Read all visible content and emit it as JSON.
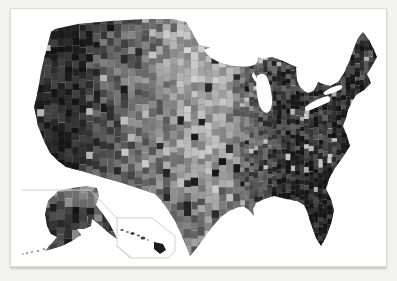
{
  "window": {
    "width": 397,
    "height": 281,
    "background_color": "#f3f3f1"
  },
  "card": {
    "background_color": "#ffffff",
    "border_color": "#dbdbd9",
    "shadow_color": "rgba(0,0,0,0.18)"
  },
  "map": {
    "kind": "choropleth",
    "subject": "united-states-counties",
    "color_scheme": "grayscale",
    "water_color": "#ffffff",
    "inset_line_color": "#c9cdc9",
    "county_border_light": "rgba(255,255,255,0.14)",
    "county_border_dark": "rgba(88,88,88,0.42)",
    "insets": [
      {
        "id": "contiguous-us"
      },
      {
        "id": "alaska"
      },
      {
        "id": "hawaii"
      }
    ],
    "seed": 20240613,
    "shading": {
      "xs": [
        33,
        70,
        100,
        130,
        160,
        185,
        215,
        235,
        255,
        275,
        300,
        340,
        380
      ],
      "values": [
        0.86,
        0.92,
        0.7,
        0.58,
        0.48,
        0.3,
        0.28,
        0.5,
        0.66,
        0.8,
        0.85,
        0.86,
        0.82
      ],
      "noise": 0.44,
      "outlier_rate": 0.08,
      "gray_max": 225,
      "gray_span": 205
    },
    "cells": {
      "west_step": 7,
      "east_step": 4.6,
      "split_x": 235
    }
  }
}
